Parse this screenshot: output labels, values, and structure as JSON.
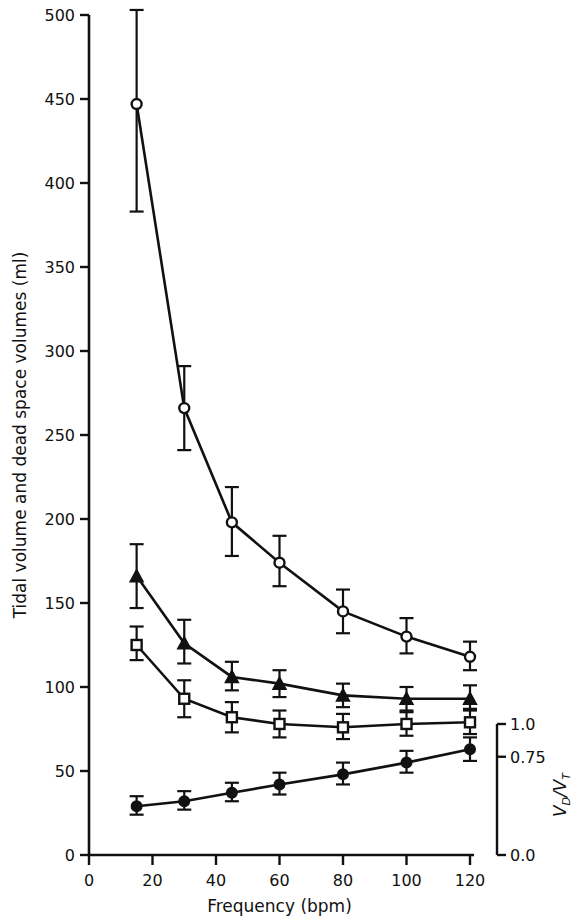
{
  "chart_data": {
    "type": "line",
    "title": "",
    "xlabel": "Frequency (bpm)",
    "ylabel": "Tidal volume and dead space volumes (ml)",
    "y2label": "VD/VT",
    "xlim": [
      0,
      124
    ],
    "ylim": [
      0,
      505
    ],
    "grid": false,
    "legend": "none",
    "x": [
      15,
      30,
      45,
      60,
      80,
      100,
      120
    ],
    "xticks": [
      0,
      20,
      40,
      60,
      80,
      100,
      120
    ],
    "xticklabels": [
      "0",
      "20",
      "40",
      "60",
      "80",
      "100",
      "120"
    ],
    "yticks": [
      0,
      50,
      100,
      150,
      200,
      250,
      300,
      350,
      400,
      450,
      500
    ],
    "yticklabels": [
      "0",
      "50",
      "100",
      "150",
      "200",
      "250",
      "300",
      "350",
      "400",
      "450",
      "500"
    ],
    "y2ticks": [
      0.0,
      0.75,
      1.0
    ],
    "y2ticklabels": [
      "0.0",
      "0.75",
      "1.0"
    ],
    "y2_axis_bracket": true,
    "series": [
      {
        "name": "Tidal volume",
        "marker": "open-circle",
        "values": [
          447,
          266,
          198,
          174,
          145,
          130,
          118
        ],
        "err_low": [
          383,
          241,
          178,
          160,
          132,
          120,
          110
        ],
        "err_high": [
          503,
          291,
          219,
          190,
          158,
          141,
          127
        ]
      },
      {
        "name": "Physiological dead space",
        "marker": "filled-triangle",
        "values": [
          166,
          126,
          106,
          102,
          95,
          93,
          93
        ],
        "err_low": [
          147,
          114,
          98,
          94,
          88,
          86,
          86
        ],
        "err_high": [
          185,
          140,
          115,
          110,
          102,
          100,
          101
        ]
      },
      {
        "name": "Anatomical dead space",
        "marker": "open-square",
        "values": [
          125,
          93,
          82,
          78,
          76,
          78,
          79
        ],
        "err_low": [
          116,
          82,
          73,
          70,
          69,
          71,
          72
        ],
        "err_high": [
          136,
          104,
          91,
          86,
          84,
          85,
          87
        ]
      },
      {
        "name": "VD/VT ratio",
        "marker": "filled-circle",
        "values": [
          29,
          32,
          37,
          42,
          48,
          55,
          63
        ],
        "err_low": [
          24,
          27,
          32,
          36,
          42,
          49,
          56
        ],
        "err_high": [
          35,
          38,
          43,
          49,
          55,
          62,
          70
        ]
      }
    ]
  },
  "axes": {
    "x_title": "Frequency (bpm)",
    "y_title": "Tidal volume and dead space volumes (ml)",
    "y2_title_num": "V",
    "y2_title_num_sub": "D",
    "y2_title_slash": "/V",
    "y2_title_den_sub": "T"
  },
  "colors": {
    "ink": "#111111",
    "background": "#ffffff"
  }
}
